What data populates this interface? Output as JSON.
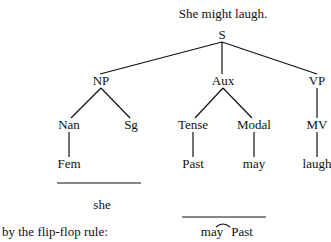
{
  "title": "She might laugh.",
  "tree": {
    "root": "S",
    "level1": [
      "NP",
      "Aux",
      "VP"
    ],
    "level2": [
      "Nan",
      "Sg",
      "Tense",
      "Modal",
      "MV"
    ],
    "level3": [
      "Fem",
      "Past",
      "may",
      "laugh"
    ]
  },
  "derived": {
    "np_result": "she",
    "rule_label": "by the flip-flop rule:",
    "aux_result_left": "may",
    "aux_result_right": "Past"
  },
  "colors": {
    "ink": "#111111",
    "background": "#ffffff"
  }
}
